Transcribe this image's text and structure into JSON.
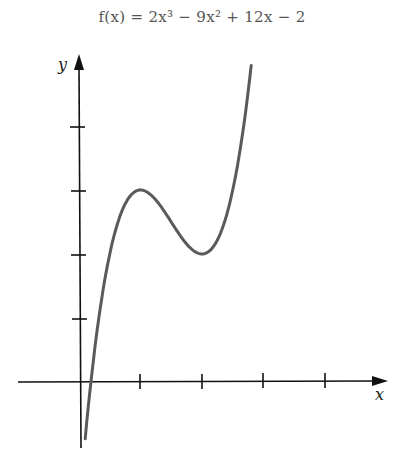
{
  "title": "f(x) = 2x³ − 9x² + 12x − 2",
  "chart_data": {
    "type": "line",
    "xlabel": "x",
    "ylabel": "y",
    "xlim": [
      -1,
      4.9
    ],
    "ylim": [
      -1.1,
      5.2
    ],
    "x_ticks": [
      1,
      2,
      3,
      4
    ],
    "y_ticks": [
      1,
      2,
      3,
      4
    ],
    "tick_labels_shown": false,
    "grid": false,
    "legend": null,
    "annotations": [
      "local maximum at (1, 3)",
      "local minimum at (2, 2)"
    ],
    "series": [
      {
        "name": "f(x) = 2x^3 - 9x^2 + 12x - 2",
        "x": [
          0.1,
          0.2,
          0.3,
          0.4,
          0.5,
          0.6,
          0.7,
          0.8,
          0.9,
          1.0,
          1.1,
          1.2,
          1.3,
          1.4,
          1.5,
          1.6,
          1.7,
          1.8,
          1.9,
          2.0,
          2.1,
          2.2,
          2.3,
          2.4,
          2.5,
          2.6,
          2.7,
          2.8
        ],
        "values": [
          -0.888,
          0.056,
          0.794,
          1.368,
          1.75,
          2.192,
          2.276,
          2.584,
          2.868,
          3.0,
          2.962,
          2.896,
          2.784,
          2.648,
          2.5,
          2.352,
          2.216,
          2.104,
          2.028,
          2.0,
          2.032,
          2.136,
          2.324,
          2.608,
          3.0,
          3.512,
          4.156,
          4.944
        ]
      }
    ]
  },
  "axes": {
    "x_label": "x",
    "y_label": "y"
  },
  "colors": {
    "curve": "#5a5a5a",
    "axis": "#111111",
    "title": "#555555"
  }
}
